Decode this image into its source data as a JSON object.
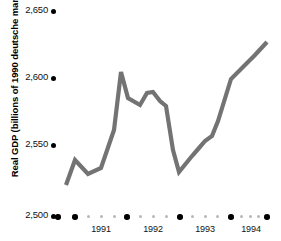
{
  "chart_data": {
    "type": "line",
    "title": "",
    "xlabel": "",
    "ylabel": "Real GDP (billions of 1990 deutsche marks)",
    "ylim": [
      2500,
      2650
    ],
    "yticks": [
      2500,
      2550,
      2600,
      2650
    ],
    "ytick_labels": [
      "2,500",
      "2,550",
      "2,600",
      "2,650"
    ],
    "xticks": [
      1990.5,
      1991,
      1992,
      1993,
      1994,
      1995
    ],
    "xtick_labels": [
      "1991",
      "1992",
      "1993",
      "1994"
    ],
    "grid": false,
    "legend": null,
    "line_color": "#737373",
    "x": [
      "1990Q3",
      "1990Q4",
      "1991Q1",
      "1991Q2",
      "1991Q3",
      "1991Q4",
      "1992Q1",
      "1992Q2",
      "1992Q3",
      "1992Q4",
      "1993Q1",
      "1993Q2",
      "1993Q3",
      "1993Q4",
      "1994Q1",
      "1994Q2",
      "1994Q3",
      "1994Q4"
    ],
    "values": [
      2527,
      2545,
      2532,
      2541,
      2603,
      2586,
      2590,
      2584,
      2582,
      2533,
      2545,
      2556,
      2563,
      2591,
      2601,
      2612,
      2623,
      2632
    ],
    "series": [
      {
        "name": "Real GDP",
        "values": [
          2527,
          2545,
          2532,
          2541,
          2603,
          2586,
          2590,
          2584,
          2582,
          2533,
          2545,
          2556,
          2563,
          2591,
          2601,
          2612,
          2623,
          2632
        ]
      }
    ]
  },
  "yaxis": {
    "ticks": [
      {
        "label": "2,650",
        "top": 4,
        "dot_top": 9
      },
      {
        "label": "2,600",
        "top": 71,
        "dot_top": 76
      },
      {
        "label": "2,550",
        "top": 138,
        "dot_top": 143
      },
      {
        "label": "2,500",
        "top": 209,
        "dot_top": 214
      }
    ]
  },
  "xaxis": {
    "major_dots": [
      58,
      75,
      127,
      180,
      231,
      267
    ],
    "minor_dots": [
      88,
      101,
      114,
      140,
      153,
      166,
      192,
      205,
      218,
      244,
      254,
      261
    ],
    "labels": [
      {
        "text": "1991",
        "center": 101
      },
      {
        "text": "1992",
        "center": 153
      },
      {
        "text": "1993",
        "center": 205
      },
      {
        "text": "1994",
        "center": 251
      }
    ]
  },
  "polyline": "66,185 75,160 88,174 101,168 114,130 121,72 128,98 140,105 147,93 153,92 160,101 166,106 173,150 179,172 192,156 199,148 205,141 212,136 218,121 231,79 244,66 255,55 267,42"
}
